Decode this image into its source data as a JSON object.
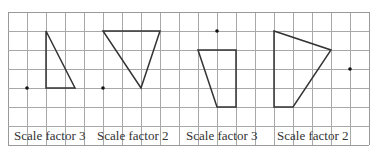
{
  "diagram": {
    "grid": {
      "x0": 8,
      "y0": 12,
      "cell": 19,
      "cols": 19,
      "rows": 7,
      "line_color": "#a8a8a8",
      "border_color": "#999999"
    },
    "shape_color": "#333333",
    "items": [
      {
        "label": "Scale factor 3",
        "label_x": 14,
        "shape": "triangle",
        "points": [
          [
            46,
            31
          ],
          [
            46,
            88
          ],
          [
            75,
            88
          ]
        ],
        "centre": [
          27,
          88
        ]
      },
      {
        "label": "Scale factor 2",
        "label_x": 97,
        "shape": "triangle",
        "points": [
          [
            103,
            31
          ],
          [
            160,
            31
          ],
          [
            141,
            88
          ]
        ],
        "centre": [
          103,
          88
        ]
      },
      {
        "label": "Scale factor 3",
        "label_x": 186,
        "shape": "quadrilateral",
        "points": [
          [
            198,
            50
          ],
          [
            236,
            50
          ],
          [
            236,
            107
          ],
          [
            217,
            107
          ]
        ],
        "centre": [
          217,
          31
        ]
      },
      {
        "label": "Scale factor 2",
        "label_x": 277,
        "shape": "quadrilateral",
        "points": [
          [
            274,
            31
          ],
          [
            331,
            50
          ],
          [
            293,
            107
          ],
          [
            274,
            107
          ]
        ],
        "centre": [
          350,
          69
        ]
      }
    ]
  }
}
